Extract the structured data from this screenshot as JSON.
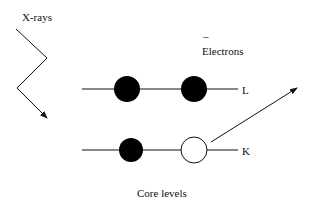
{
  "labels": {
    "xrays": "X-rays",
    "electron_charge": "–",
    "electrons": "Electrons",
    "level_l": "L",
    "level_k": "K",
    "caption": "Core levels"
  },
  "colors": {
    "ink": "#111111",
    "background": "#ffffff"
  }
}
